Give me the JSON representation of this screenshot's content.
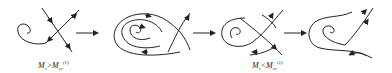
{
  "diagram": {
    "type": "phase-portrait-sequence",
    "panels": [
      {
        "id": 1,
        "label": {
          "base": "M",
          "sub": "s",
          "op": ">",
          "base2": "M",
          "sub2": "cr",
          "sup2": "(1)"
        }
      },
      {
        "id": 2,
        "label": null
      },
      {
        "id": 3,
        "label": {
          "base": "M",
          "sub": "s",
          "op": "<",
          "base2": "M",
          "sub2": "cr",
          "sup2": "(1)"
        }
      },
      {
        "id": 4,
        "label": null
      }
    ],
    "arrows_between": 3,
    "colors": {
      "stroke": "#222222",
      "background": "#ffffff"
    }
  }
}
